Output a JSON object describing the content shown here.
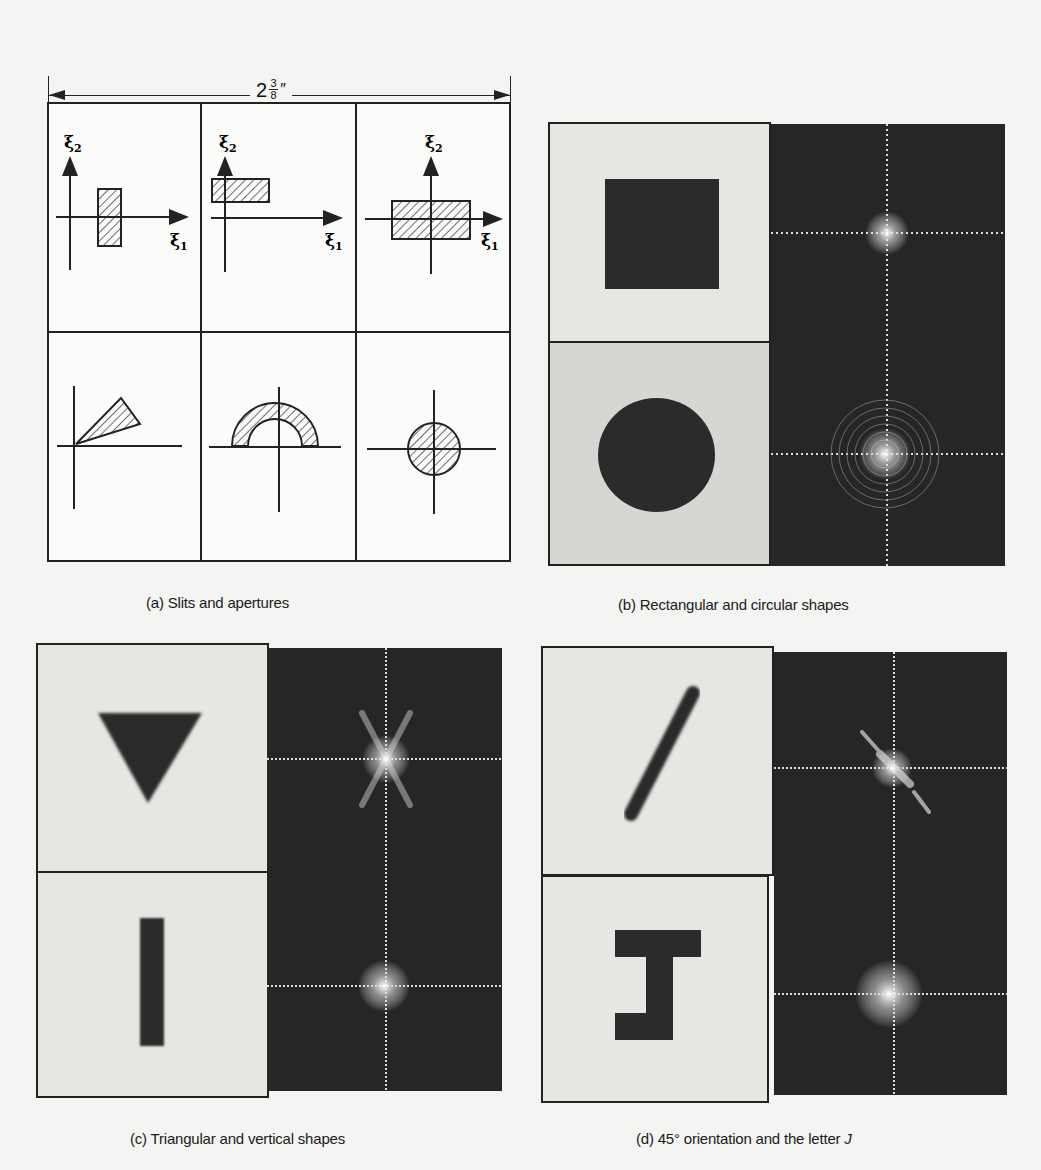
{
  "dimension": {
    "whole": "2",
    "numerator": "3",
    "denominator": "8",
    "unit": "″"
  },
  "panel_a": {
    "caption": "(a) Slits and apertures",
    "axis_labels": {
      "x": "ξ",
      "x_sub": "1",
      "y": "ξ",
      "y_sub": "2"
    },
    "cells": [
      {
        "shape": "vertical-slit-offset-right"
      },
      {
        "shape": "horizontal-slit-upper-left"
      },
      {
        "shape": "centered-rectangle"
      },
      {
        "shape": "wedge"
      },
      {
        "shape": "half-annulus"
      },
      {
        "shape": "centered-disk"
      }
    ]
  },
  "panel_b": {
    "caption": "(b) Rectangular and circular shapes",
    "images": [
      {
        "object": "square",
        "spectrum": "sinc-cross"
      },
      {
        "object": "circle",
        "spectrum": "airy-rings"
      }
    ]
  },
  "panel_c": {
    "caption": "(c) Triangular and vertical shapes",
    "images": [
      {
        "object": "inverted-triangle",
        "spectrum": "six-point-star"
      },
      {
        "object": "vertical-bar",
        "spectrum": "cross"
      }
    ]
  },
  "panel_d": {
    "caption_prefix": "(d) 45° orientation and the letter ",
    "caption_letter": "J",
    "images": [
      {
        "object": "diagonal-bar-45deg",
        "spectrum": "diagonal-streak"
      },
      {
        "object": "letter-J",
        "spectrum": "cross-with-diagonal-spread"
      }
    ]
  },
  "colors": {
    "ink": "#222222",
    "paper": "#f4f4f2",
    "spectrum_bg": "#262626",
    "object_bg_light": "#e6e6e2",
    "object_bg_mid": "#d6d6d2",
    "object_dark": "#2b2b2b"
  }
}
